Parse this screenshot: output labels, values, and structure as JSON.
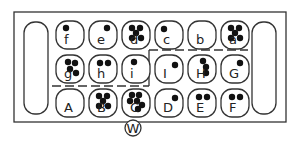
{
  "board": {
    "title": "Mancala-style board diagram",
    "stores": [
      {
        "name": "left-store",
        "label": ""
      },
      {
        "name": "right-store",
        "label": ""
      }
    ],
    "rows": [
      {
        "name": "top-row",
        "pits": [
          {
            "label": "f",
            "seeds": 1
          },
          {
            "label": "e",
            "seeds": 1
          },
          {
            "label": "d",
            "seeds": 5
          },
          {
            "label": "c",
            "seeds": 1
          },
          {
            "label": "b",
            "seeds": 0
          },
          {
            "label": "a",
            "seeds": 5
          }
        ]
      },
      {
        "name": "middle-row",
        "pits": [
          {
            "label": "g",
            "seeds": 4
          },
          {
            "label": "h",
            "seeds": 2
          },
          {
            "label": "i",
            "seeds": 1
          },
          {
            "label": "I",
            "seeds": 1
          },
          {
            "label": "H",
            "seeds": 3
          },
          {
            "label": "G",
            "seeds": 1
          }
        ]
      },
      {
        "name": "bottom-row",
        "pits": [
          {
            "label": "A",
            "seeds": 0
          },
          {
            "label": "B",
            "seeds": 5
          },
          {
            "label": "C",
            "seeds": 6
          },
          {
            "label": "D",
            "seeds": 1
          },
          {
            "label": "E",
            "seeds": 2
          },
          {
            "label": "F",
            "seeds": 2
          }
        ]
      }
    ],
    "player_marker": "W",
    "colors": {
      "line": "#333333",
      "seed": "#111111",
      "background": "#ffffff"
    }
  }
}
